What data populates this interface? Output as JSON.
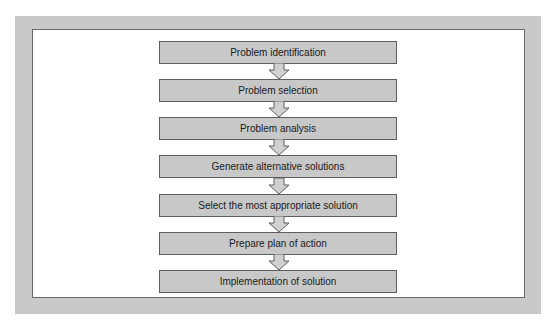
{
  "diagram": {
    "type": "flowchart",
    "direction": "top-to-bottom",
    "steps": [
      {
        "label": "Problem identification"
      },
      {
        "label": "Problem selection"
      },
      {
        "label": "Problem analysis"
      },
      {
        "label": "Generate alternative solutions"
      },
      {
        "label": "Select the most appropriate solution"
      },
      {
        "label": "Prepare plan of action"
      },
      {
        "label": "Implementation of solution"
      }
    ],
    "connectors": [
      {
        "from": 0,
        "to": 1,
        "icon": "hollow-down-arrow-icon"
      },
      {
        "from": 1,
        "to": 2,
        "icon": "hollow-down-arrow-icon"
      },
      {
        "from": 2,
        "to": 3,
        "icon": "hollow-down-arrow-icon"
      },
      {
        "from": 3,
        "to": 4,
        "icon": "hollow-down-arrow-icon"
      },
      {
        "from": 4,
        "to": 5,
        "icon": "hollow-down-arrow-icon"
      },
      {
        "from": 5,
        "to": 6,
        "icon": "hollow-down-arrow-icon"
      }
    ],
    "colors": {
      "frame": "#c9c9c9",
      "box_fill": "#c8c8c8",
      "box_border": "#5e5e5e",
      "arrow_fill": "#d0d0d0",
      "text": "#1a1a1a"
    }
  }
}
